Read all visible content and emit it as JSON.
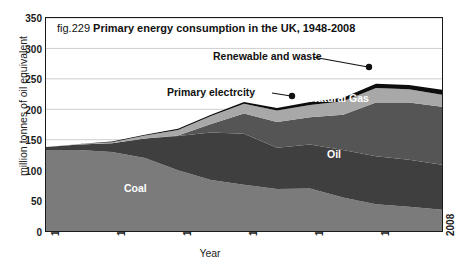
{
  "figure": {
    "fig_number": "fig.229",
    "title": "Primary energy consumption in the UK, 1948-2008"
  },
  "axes": {
    "ylabel": "million tonnes of oil equivalent",
    "xlabel": "Year",
    "yticks": [
      "0",
      "50",
      "100",
      "150",
      "200",
      "250",
      "300",
      "350"
    ],
    "xticks": [
      "1948",
      "1958",
      "1968",
      "1978",
      "1988",
      "1998",
      "2008"
    ]
  },
  "labels": {
    "coal": "Coal",
    "oil": "Oil",
    "natural_gas": "Natural Gas",
    "primary_electricity": "Primary electrcity",
    "renewable": "Renewable and waste"
  },
  "colors": {
    "coal": "#7b7b7b",
    "oil": "#3f3f3f",
    "natural_gas": "#555555",
    "primary_electricity": "#a8a8a8",
    "renewable": "#0d0d0d",
    "frame": "#1a1a1a",
    "grid": "#cfcfcf",
    "background": "#ffffff"
  },
  "chart_data": {
    "type": "area",
    "stacked": true,
    "title": "fig.229 Primary energy consumption in the UK, 1948-2008",
    "xlabel": "Year",
    "ylabel": "million tonnes of oil equivalent",
    "xlim": [
      1948,
      2008
    ],
    "ylim": [
      0,
      350
    ],
    "ytick_step": 50,
    "grid": "horizontal",
    "legend": "inline-annotations",
    "x": [
      1948,
      1953,
      1958,
      1963,
      1968,
      1973,
      1978,
      1983,
      1988,
      1993,
      1998,
      2003,
      2008
    ],
    "series": [
      {
        "name": "Coal",
        "color": "#7b7b7b",
        "values": [
          133,
          133,
          130,
          120,
          100,
          84,
          76,
          69,
          70,
          55,
          44,
          40,
          35
        ]
      },
      {
        "name": "Oil",
        "color": "#3f3f3f",
        "values": [
          5,
          9,
          14,
          32,
          56,
          78,
          84,
          68,
          72,
          78,
          79,
          77,
          74
        ]
      },
      {
        "name": "Natural Gas",
        "color": "#555555",
        "values": [
          0,
          0,
          0,
          0,
          1,
          14,
          33,
          42,
          45,
          58,
          88,
          94,
          95
        ]
      },
      {
        "name": "Primary electrcity",
        "color": "#a8a8a8",
        "values": [
          0,
          1,
          2,
          5,
          9,
          13,
          16,
          19,
          20,
          22,
          24,
          22,
          20
        ]
      },
      {
        "name": "Renewable and waste",
        "color": "#0d0d0d",
        "values": [
          0,
          0,
          1,
          1,
          2,
          2,
          3,
          4,
          5,
          6,
          7,
          7,
          8
        ]
      }
    ],
    "totals": [
      138,
      143,
      147,
      158,
      168,
      191,
      212,
      202,
      212,
      219,
      242,
      240,
      232
    ],
    "annotations": [
      {
        "text": "Renewable and waste",
        "target_year": 1999,
        "layer": "Renewable and waste"
      },
      {
        "text": "Primary electrcity",
        "target_year": 1988,
        "layer": "Primary electrcity"
      },
      {
        "text": "Natural Gas",
        "layer": "Natural Gas",
        "inline": true
      },
      {
        "text": "Oil",
        "layer": "Oil",
        "inline": true
      },
      {
        "text": "Coal",
        "layer": "Coal",
        "inline": true
      }
    ]
  }
}
